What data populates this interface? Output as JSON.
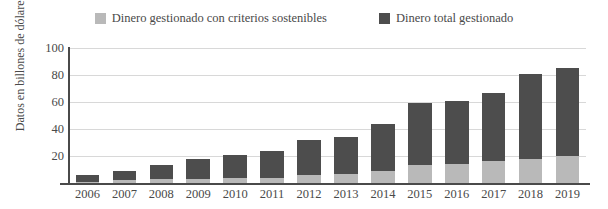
{
  "chart_data": {
    "type": "bar",
    "title": "",
    "subtitle": "",
    "xlabel": "",
    "ylabel": "Datos en billones de dólares",
    "categories": [
      "2006",
      "2007",
      "2008",
      "2009",
      "2010",
      "2011",
      "2012",
      "2013",
      "2014",
      "2015",
      "2016",
      "2017",
      "2018",
      "2019"
    ],
    "stacked": true,
    "series": [
      {
        "name": "Dinero gestionado con criterios sostenibles",
        "color": "#b9b9b9",
        "values": [
          1,
          2,
          3,
          3,
          4,
          4,
          6,
          7,
          9,
          13,
          14,
          16,
          18,
          20
        ]
      },
      {
        "name": "Dinero total gestionado",
        "color": "#4d4d4d",
        "values": [
          6,
          9,
          13,
          18,
          21,
          24,
          32,
          34,
          44,
          59,
          61,
          67,
          81,
          85
        ]
      }
    ],
    "ylim": [
      0,
      100
    ],
    "yticks": [
      20,
      40,
      60,
      80,
      100
    ],
    "ytick_labels": [
      "20",
      "40",
      "60",
      "80",
      "100"
    ],
    "grid": true,
    "legend_position": "top"
  },
  "legend": {
    "entries": [
      {
        "label": "Dinero gestionado con criterios sostenibles",
        "color": "#b9b9b9",
        "swatch_name": "legend-swatch-sustainable"
      },
      {
        "label": "Dinero total gestionado",
        "color": "#4d4d4d",
        "swatch_name": "legend-swatch-total"
      }
    ]
  },
  "axes": {
    "y_title": "Datos en billones de dólares"
  }
}
